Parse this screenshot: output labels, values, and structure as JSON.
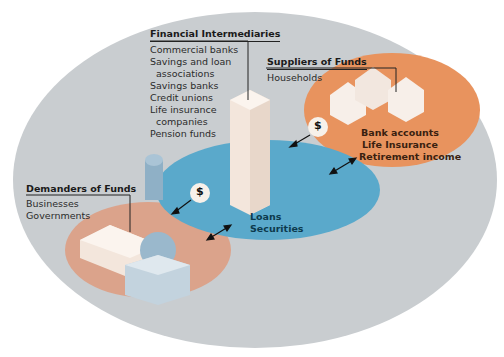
{
  "diagram": {
    "colors": {
      "outer": "#c9cdd0",
      "market": "#5aa9cb",
      "suppliers": "#e8935e",
      "demanders": "#dba38b",
      "text_dark": "#1a1a1a",
      "text_blue": "#0d3a4d",
      "text_brown": "#3a1f10"
    },
    "intermediaries": {
      "title": "Financial Intermediaries",
      "items": [
        "Commercial banks",
        "Savings and loan",
        "associations",
        "Savings banks",
        "Credit unions",
        "Life insurance",
        "companies",
        "Pension funds"
      ]
    },
    "suppliers": {
      "title": "Suppliers of Funds",
      "subtitle": "Households",
      "products": [
        "Bank accounts",
        "Life Insurance",
        "Retirement income"
      ]
    },
    "demanders": {
      "title": "Demanders of Funds",
      "items": [
        "Businesses",
        "Governments"
      ]
    },
    "market": {
      "items": [
        "Loans",
        "Securities"
      ]
    },
    "dollar_symbol": "$"
  }
}
